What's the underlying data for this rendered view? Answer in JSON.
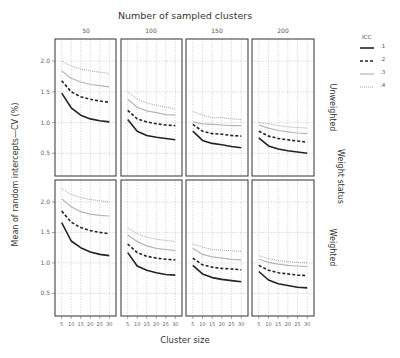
{
  "chart_data": {
    "type": "line",
    "title": "Number of sampled clusters",
    "xlabel": "Cluster size",
    "ylabel": "Mean of random intercepts—CV (%)",
    "facet_col_title": "Number of sampled clusters",
    "facet_row_title": "Weight status",
    "facet_cols": [
      "50",
      "100",
      "150",
      "200"
    ],
    "facet_rows": [
      "Unweighted",
      "Weighted"
    ],
    "x": [
      5,
      10,
      15,
      20,
      25,
      30
    ],
    "x_ticks": [
      "5",
      "10",
      "15",
      "20",
      "25",
      "30"
    ],
    "y_ticks": [
      "0.5",
      "1.0",
      "1.5",
      "2.0"
    ],
    "ylim": [
      0.13,
      2.36
    ],
    "grid": true,
    "legend": {
      "title": "ICC",
      "position": "right",
      "entries": [
        {
          "label": ".1",
          "style": "solid",
          "color": "#222222"
        },
        {
          "label": ".2",
          "style": "dashed",
          "color": "#222222"
        },
        {
          "label": ".3",
          "style": "solid",
          "color": "#b0b0b0"
        },
        {
          "label": ".4",
          "style": "dotted",
          "color": "#999999"
        }
      ]
    },
    "panels": [
      {
        "row": "Unweighted",
        "col": "50",
        "series": [
          {
            "name": ".1",
            "values": [
              1.48,
              1.24,
              1.12,
              1.06,
              1.03,
              1.01
            ]
          },
          {
            "name": ".2",
            "values": [
              1.68,
              1.5,
              1.42,
              1.38,
              1.35,
              1.33
            ]
          },
          {
            "name": ".3",
            "values": [
              1.84,
              1.72,
              1.66,
              1.62,
              1.6,
              1.58
            ]
          },
          {
            "name": ".4",
            "values": [
              2.0,
              1.92,
              1.87,
              1.84,
              1.82,
              1.8
            ]
          }
        ]
      },
      {
        "row": "Unweighted",
        "col": "100",
        "series": [
          {
            "name": ".1",
            "values": [
              1.05,
              0.86,
              0.79,
              0.76,
              0.74,
              0.72
            ]
          },
          {
            "name": ".2",
            "values": [
              1.2,
              1.06,
              1.01,
              0.98,
              0.96,
              0.95
            ]
          },
          {
            "name": ".3",
            "values": [
              1.38,
              1.25,
              1.19,
              1.16,
              1.13,
              1.12
            ]
          },
          {
            "name": ".4",
            "values": [
              1.5,
              1.38,
              1.32,
              1.28,
              1.25,
              1.22
            ]
          }
        ]
      },
      {
        "row": "Unweighted",
        "col": "150",
        "series": [
          {
            "name": ".1",
            "values": [
              0.86,
              0.71,
              0.66,
              0.64,
              0.61,
              0.59
            ]
          },
          {
            "name": ".2",
            "values": [
              0.97,
              0.86,
              0.82,
              0.81,
              0.79,
              0.78
            ]
          },
          {
            "name": ".3",
            "values": [
              1.01,
              0.98,
              0.97,
              0.96,
              0.95,
              0.95
            ]
          },
          {
            "name": ".4",
            "values": [
              1.18,
              1.12,
              1.08,
              1.08,
              1.06,
              1.05
            ]
          }
        ]
      },
      {
        "row": "Unweighted",
        "col": "200",
        "series": [
          {
            "name": ".1",
            "values": [
              0.75,
              0.62,
              0.57,
              0.54,
              0.52,
              0.5
            ]
          },
          {
            "name": ".2",
            "values": [
              0.86,
              0.78,
              0.74,
              0.72,
              0.7,
              0.68
            ]
          },
          {
            "name": ".3",
            "values": [
              0.96,
              0.91,
              0.87,
              0.85,
              0.83,
              0.82
            ]
          },
          {
            "name": ".4",
            "values": [
              1.0,
              0.98,
              0.95,
              0.93,
              0.92,
              0.91
            ]
          }
        ]
      },
      {
        "row": "Weighted",
        "col": "50",
        "series": [
          {
            "name": ".1",
            "values": [
              1.66,
              1.36,
              1.25,
              1.18,
              1.14,
              1.12
            ]
          },
          {
            "name": ".2",
            "values": [
              1.85,
              1.67,
              1.58,
              1.53,
              1.5,
              1.48
            ]
          },
          {
            "name": ".3",
            "values": [
              2.05,
              1.92,
              1.84,
              1.8,
              1.78,
              1.77
            ]
          },
          {
            "name": ".4",
            "values": [
              2.22,
              2.12,
              2.07,
              2.04,
              2.02,
              2.0
            ]
          }
        ]
      },
      {
        "row": "Weighted",
        "col": "100",
        "series": [
          {
            "name": ".1",
            "values": [
              1.17,
              0.95,
              0.88,
              0.84,
              0.81,
              0.8
            ]
          },
          {
            "name": ".2",
            "values": [
              1.31,
              1.17,
              1.11,
              1.08,
              1.06,
              1.05
            ]
          },
          {
            "name": ".3",
            "values": [
              1.46,
              1.35,
              1.28,
              1.24,
              1.22,
              1.2
            ]
          },
          {
            "name": ".4",
            "values": [
              1.57,
              1.48,
              1.42,
              1.39,
              1.37,
              1.35
            ]
          }
        ]
      },
      {
        "row": "Weighted",
        "col": "150",
        "series": [
          {
            "name": ".1",
            "values": [
              0.96,
              0.82,
              0.76,
              0.73,
              0.71,
              0.69
            ]
          },
          {
            "name": ".2",
            "values": [
              1.08,
              0.97,
              0.93,
              0.91,
              0.9,
              0.89
            ]
          },
          {
            "name": ".3",
            "values": [
              1.24,
              1.14,
              1.1,
              1.08,
              1.06,
              1.05
            ]
          },
          {
            "name": ".4",
            "values": [
              1.31,
              1.26,
              1.22,
              1.21,
              1.2,
              1.19
            ]
          }
        ]
      },
      {
        "row": "Weighted",
        "col": "200",
        "series": [
          {
            "name": ".1",
            "values": [
              0.86,
              0.72,
              0.66,
              0.63,
              0.6,
              0.59
            ]
          },
          {
            "name": ".2",
            "values": [
              0.96,
              0.88,
              0.84,
              0.82,
              0.8,
              0.79
            ]
          },
          {
            "name": ".3",
            "values": [
              1.06,
              1.01,
              0.98,
              0.96,
              0.95,
              0.94
            ]
          },
          {
            "name": ".4",
            "values": [
              1.12,
              1.07,
              1.04,
              1.02,
              1.01,
              1.0
            ]
          }
        ]
      }
    ]
  }
}
